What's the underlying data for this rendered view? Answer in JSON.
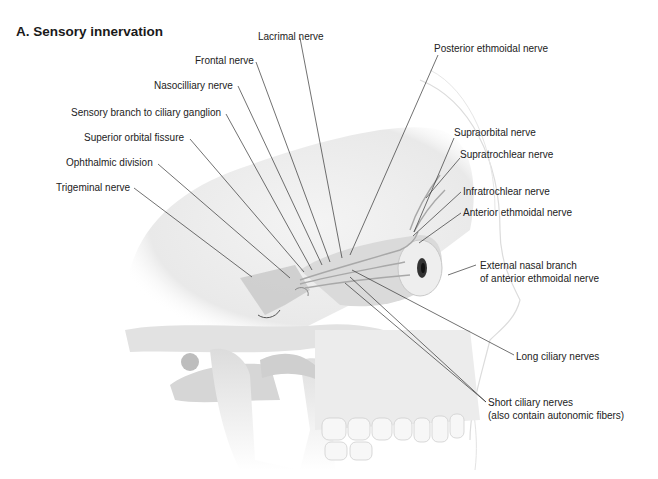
{
  "title": "A. Sensory innervation",
  "labels": {
    "lacrimal": "Lacrimal nerve",
    "frontal": "Frontal nerve",
    "nasociliary": "Nasocilliary nerve",
    "sensory_branch": "Sensory branch to ciliary ganglion",
    "superior_orbital_fissure": "Superior orbital fissure",
    "ophthalmic_division": "Ophthalmic division",
    "trigeminal": "Trigeminal nerve",
    "posterior_ethmoidal": "Posterior ethmoidal nerve",
    "supraorbital": "Supraorbital nerve",
    "supratrochlear": "Supratrochlear nerve",
    "infratrochlear": "Infratrochlear nerve",
    "anterior_ethmoidal": "Anterior ethmoidal nerve",
    "external_nasal_1": "External nasal branch",
    "external_nasal_2": "of anterior ethmoidal nerve",
    "long_ciliary": "Long ciliary nerves",
    "short_ciliary_1": "Short ciliary nerves",
    "short_ciliary_2": "(also contain autonomic fibers)"
  },
  "colors": {
    "text": "#222222",
    "leader": "#333333",
    "bone_light": "#f2f2f2",
    "bone_mid": "#dedede",
    "bone_dark": "#c4c4c4"
  }
}
